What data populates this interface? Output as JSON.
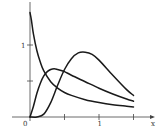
{
  "chart_data": {
    "type": "line",
    "title": "",
    "xlabel": "x",
    "ylabel": "",
    "xlim": [
      0,
      1.55
    ],
    "ylim": [
      0,
      1.55
    ],
    "grid": false,
    "legend": null,
    "x_ticks": [
      0.5,
      1,
      1.5
    ],
    "x_tick_labels": {
      "0": "0",
      "1": "1"
    },
    "y_ticks": [
      0.5,
      1
    ],
    "y_tick_labels": {
      "1": "1"
    },
    "origin_label": "0",
    "series": [
      {
        "name": "decaying curve",
        "x": [
          0.0,
          0.02,
          0.05,
          0.1,
          0.15,
          0.2,
          0.3,
          0.4,
          0.5,
          0.6,
          0.8,
          1.0,
          1.2,
          1.4,
          1.5
        ],
        "y": [
          1.45,
          1.35,
          1.15,
          0.92,
          0.76,
          0.64,
          0.49,
          0.4,
          0.34,
          0.3,
          0.24,
          0.2,
          0.17,
          0.15,
          0.14
        ]
      },
      {
        "name": "early hump",
        "x": [
          0.0,
          0.05,
          0.1,
          0.15,
          0.2,
          0.25,
          0.3,
          0.35,
          0.4,
          0.5,
          0.6,
          0.8,
          1.0,
          1.2,
          1.4,
          1.5
        ],
        "y": [
          0.0,
          0.15,
          0.33,
          0.47,
          0.57,
          0.63,
          0.66,
          0.67,
          0.66,
          0.63,
          0.58,
          0.49,
          0.4,
          0.32,
          0.25,
          0.22
        ]
      },
      {
        "name": "late hump",
        "x": [
          0.0,
          0.1,
          0.2,
          0.3,
          0.4,
          0.5,
          0.6,
          0.7,
          0.8,
          0.9,
          1.0,
          1.2,
          1.4,
          1.5
        ],
        "y": [
          0.0,
          0.0,
          0.04,
          0.2,
          0.44,
          0.66,
          0.81,
          0.89,
          0.9,
          0.87,
          0.79,
          0.58,
          0.38,
          0.3
        ]
      }
    ]
  },
  "axes": {
    "x_axis_label": "x",
    "origin_label": "0",
    "x_tick_one_label": "1",
    "y_tick_one_label": "1"
  }
}
